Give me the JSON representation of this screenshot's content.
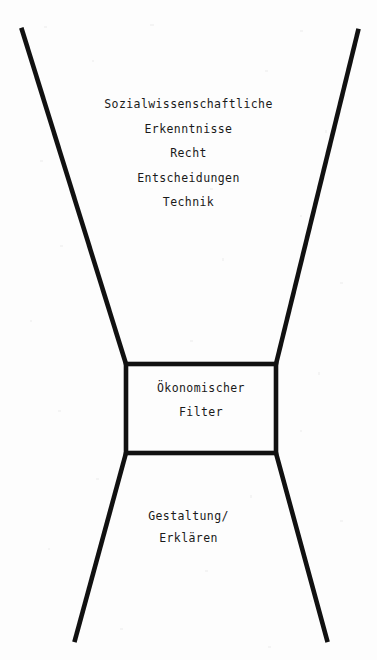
{
  "diagram": {
    "type": "funnel",
    "stroke_color": "#111111",
    "background_color": "#fdfdfd",
    "text_color": "#1a1a1a",
    "input_labels": [
      "Sozialwissenschaftliche",
      "Erkenntnisse",
      "Recht",
      "Entscheidungen",
      "Technik"
    ],
    "filter_labels": [
      "Ökonomischer",
      "Filter"
    ],
    "output_labels": [
      "Gestaltung/",
      "Erklären"
    ],
    "geometry": {
      "top_left_start": [
        22,
        30
      ],
      "top_right_start": [
        358,
        31
      ],
      "box_top_left": [
        126,
        364
      ],
      "box_top_right": [
        276,
        364
      ],
      "box_bottom_left": [
        126,
        453
      ],
      "box_bottom_right": [
        276,
        453
      ],
      "bottom_left_end": [
        75,
        640
      ],
      "bottom_right_end": [
        327,
        640
      ],
      "line_width": 4.6
    }
  }
}
